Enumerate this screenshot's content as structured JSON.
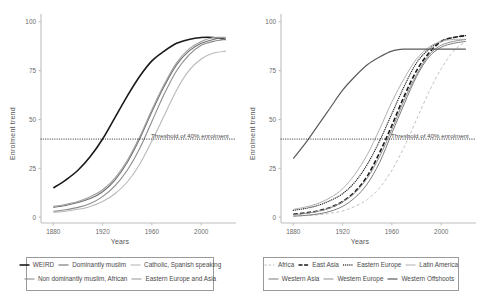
{
  "figure": {
    "panels": [
      {
        "id": "left",
        "axis": {
          "xlabel": "Years",
          "ylabel": "Enrolment trend",
          "xticks": [
            "1880",
            "1920",
            "1960",
            "2000"
          ],
          "xtick_values": [
            1880,
            1920,
            1960,
            2000
          ],
          "yticks": [
            "0",
            "25",
            "50",
            "75",
            "100"
          ],
          "ytick_values": [
            0,
            25,
            50,
            75,
            100
          ],
          "xlim": [
            1870,
            2025
          ],
          "ylim": [
            -3,
            103
          ],
          "grid": false
        },
        "annotation": {
          "threshold_label": "Threshold of 40% enrolment",
          "threshold_value": 40,
          "line_style": "dotted",
          "color": "#1a1a1a"
        },
        "legend": {
          "position": "below",
          "rows": [
            [
              "WEIRD",
              "Dominantly muslim",
              "Catholic, Spanish speaking"
            ],
            [
              "Non dominantly muslim, African",
              "Eastern Europe and Asia"
            ]
          ]
        }
      },
      {
        "id": "right",
        "axis": {
          "xlabel": "Years",
          "ylabel": "Enrolment trend",
          "xticks": [
            "1880",
            "1920",
            "1960",
            "2000"
          ],
          "xtick_values": [
            1880,
            1920,
            1960,
            2000
          ],
          "yticks": [
            "0",
            "25",
            "50",
            "75",
            "100"
          ],
          "ytick_values": [
            0,
            25,
            50,
            75,
            100
          ],
          "xlim": [
            1870,
            2025
          ],
          "ylim": [
            -3,
            103
          ],
          "grid": false
        },
        "annotation": {
          "threshold_label": "Threshold of 40% enrolment",
          "threshold_value": 40,
          "line_style": "dotted",
          "color": "#1a1a1a"
        },
        "legend": {
          "position": "below",
          "rows": [
            [
              "Africa",
              "East Asia",
              "Eastern Europe",
              "Latin America"
            ],
            [
              "Western Asia",
              "Western Europe",
              "Western Offshoots"
            ]
          ]
        }
      }
    ]
  },
  "chart_data": [
    {
      "type": "line",
      "panel": "left",
      "title": "",
      "xlabel": "Years",
      "ylabel": "Enrolment trend",
      "xlim": [
        1870,
        2025
      ],
      "ylim": [
        -3,
        103
      ],
      "grid": false,
      "legend_position": "below",
      "x": [
        1880,
        1890,
        1900,
        1910,
        1920,
        1930,
        1940,
        1950,
        1960,
        1970,
        1980,
        1990,
        2000,
        2010,
        2020
      ],
      "annotations": [
        {
          "text": "Threshold of 40% enrolment",
          "y": 40,
          "style": "dotted-horizontal"
        }
      ],
      "series": [
        {
          "name": "WEIRD",
          "color": "#1a1a1a",
          "dash": "solid",
          "width": 1.6,
          "values": [
            15,
            19,
            24,
            31,
            40,
            51,
            62,
            72,
            80,
            85,
            89,
            91,
            92,
            92,
            91
          ]
        },
        {
          "name": "Dominantly muslim",
          "color": "#6f6f6f",
          "dash": "solid",
          "width": 1.1,
          "values": [
            5,
            6,
            7.5,
            9.5,
            13,
            19,
            28,
            40,
            54,
            67,
            78,
            85,
            89,
            91,
            92
          ]
        },
        {
          "name": "Catholic, Spanish speaking",
          "color": "#b9b9b9",
          "dash": "solid",
          "width": 1.1,
          "values": [
            2.5,
            3,
            4,
            5.5,
            8,
            12,
            18,
            27,
            39,
            52,
            65,
            75,
            81,
            84,
            85
          ]
        },
        {
          "name": "Non dominantly muslim, African",
          "color": "#8c8c8c",
          "dash": "solid",
          "width": 1.1,
          "values": [
            3,
            3.8,
            5,
            7,
            10.5,
            16,
            24,
            35,
            49,
            63,
            75,
            83,
            88,
            90,
            91
          ]
        },
        {
          "name": "Eastern Europe and Asia",
          "color": "#9e9e9e",
          "dash": "solid",
          "width": 1.1,
          "values": [
            5.5,
            6.5,
            8,
            10.5,
            14,
            20,
            29,
            41,
            55,
            68,
            79,
            86,
            90,
            92,
            92
          ]
        }
      ]
    },
    {
      "type": "line",
      "panel": "right",
      "title": "",
      "xlabel": "Years",
      "ylabel": "Enrolment trend",
      "xlim": [
        1870,
        2025
      ],
      "ylim": [
        -3,
        103
      ],
      "grid": false,
      "legend_position": "below",
      "x": [
        1880,
        1890,
        1900,
        1910,
        1920,
        1930,
        1940,
        1950,
        1960,
        1970,
        1980,
        1990,
        2000,
        2010,
        2020
      ],
      "annotations": [
        {
          "text": "Threshold of 40% enrolment",
          "y": 40,
          "style": "dotted-horizontal"
        }
      ],
      "series": [
        {
          "name": "Africa",
          "color": "#c2c2c2",
          "dash": "dashed",
          "width": 1.0,
          "values": [
            0.5,
            0.8,
            1.2,
            2,
            3.2,
            5.5,
            9,
            15,
            24,
            36,
            50,
            64,
            76,
            85,
            90
          ]
        },
        {
          "name": "East Asia",
          "color": "#1a1a1a",
          "dash": "longdash",
          "width": 1.6,
          "values": [
            1.5,
            2.2,
            3.2,
            5,
            8,
            13,
            21,
            33,
            47,
            62,
            75,
            84,
            90,
            92,
            93
          ]
        },
        {
          "name": "Eastern Europe",
          "color": "#2b2b2b",
          "dash": "dotted",
          "width": 1.3,
          "values": [
            3.5,
            4.5,
            6,
            8.5,
            12,
            18,
            27,
            39,
            53,
            67,
            79,
            86,
            90,
            92,
            93
          ]
        },
        {
          "name": "Latin America",
          "color": "#b0b0b0",
          "dash": "solid",
          "width": 1.0,
          "values": [
            4,
            5.2,
            7,
            10,
            14.5,
            22,
            32,
            45,
            59,
            71,
            81,
            87,
            90,
            91,
            91
          ]
        },
        {
          "name": "Western Asia",
          "color": "#7a7a7a",
          "dash": "solid",
          "width": 1.0,
          "values": [
            0.5,
            0.9,
            1.6,
            3,
            5.5,
            10,
            17,
            28,
            43,
            58,
            72,
            82,
            87,
            89,
            90
          ]
        },
        {
          "name": "Western Europe",
          "color": "#8f8f8f",
          "dash": "solid",
          "width": 1.0,
          "values": [
            1.2,
            1.9,
            3,
            4.8,
            7.8,
            12.5,
            20,
            31,
            45,
            60,
            73,
            83,
            88,
            90,
            91
          ]
        },
        {
          "name": "Western Offshoots",
          "color": "#5a5a5a",
          "dash": "solid",
          "width": 1.2,
          "values": [
            30,
            38,
            47,
            56,
            65,
            72,
            78,
            82,
            85,
            86,
            86,
            86,
            86,
            86,
            86
          ]
        }
      ]
    }
  ]
}
